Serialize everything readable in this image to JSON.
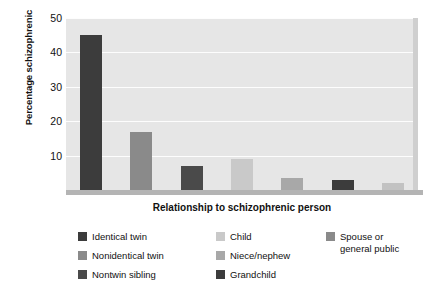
{
  "chart_data": {
    "type": "bar",
    "title": "",
    "xlabel": "Relationship to schizophrenic person",
    "ylabel": "Percentage schizophrenic",
    "categories": [
      "Identical twin",
      "Nonidentical twin",
      "Nontwin sibling",
      "Child",
      "Niece/nephew",
      "Grandchild",
      "Spouse or general public"
    ],
    "values": [
      45,
      17,
      7,
      9,
      3.5,
      3,
      2
    ],
    "ylim": [
      0,
      50
    ],
    "yticks": [
      0,
      10,
      20,
      30,
      40,
      50
    ],
    "ytick_labels": [
      "",
      "10",
      "20",
      "30",
      "40",
      "50"
    ],
    "grid": true,
    "legend_position": "bottom",
    "bar_colors": [
      "#3c3c3c",
      "#8a8a8a",
      "#4a4a4a",
      "#c9c9c9",
      "#a8a8a8",
      "#3c3c3c",
      "#c2c2c2"
    ],
    "plot_background": "#e6e6e6",
    "gridline_color": "#fdfdfd"
  },
  "legend": {
    "columns": [
      {
        "items": [
          {
            "label": "Identical twin",
            "color": "#3c3c3c"
          },
          {
            "label": "Nonidentical twin",
            "color": "#8a8a8a"
          },
          {
            "label": "Nontwin sibling",
            "color": "#4a4a4a"
          }
        ]
      },
      {
        "items": [
          {
            "label": "Child",
            "color": "#c9c9c9"
          },
          {
            "label": "Niece/nephew",
            "color": "#a8a8a8"
          },
          {
            "label": "Grandchild",
            "color": "#3c3c3c"
          }
        ]
      },
      {
        "items": [
          {
            "label": "Spouse or\ngeneral public",
            "color": "#8a8a8a"
          }
        ]
      }
    ]
  }
}
